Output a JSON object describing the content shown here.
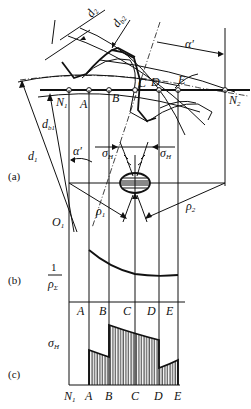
{
  "figure": {
    "type": "gear meshing contact stress diagram",
    "panels": [
      {
        "id": "a",
        "label": "(a)"
      },
      {
        "id": "b",
        "label": "(b)"
      },
      {
        "id": "c",
        "label": "(c)"
      }
    ],
    "points": {
      "N1": "N",
      "N1_sub": "1",
      "A": "A",
      "B": "B",
      "C": "C",
      "D": "D",
      "E": "E",
      "N2": "N",
      "N2_sub": "2",
      "O1": "O",
      "O1_sub": "1"
    },
    "dimension_labels": {
      "d2_prime": "d",
      "d2_prime_sub": "2",
      "d2_prime_mark": "′",
      "db2": "d",
      "db2_sub": "b2",
      "db1": "d",
      "db1_sub": "b1",
      "d1_prime": "d",
      "d1_prime_sub": "1",
      "d1_prime_mark": "′",
      "alpha_top": "α′",
      "alpha_left": "α′"
    },
    "stress_labels": {
      "sigma_left": "σ",
      "sigma_left_sub": "H",
      "sigma_right": "σ",
      "sigma_right_sub": "H",
      "rho1": "ρ",
      "rho1_sub": "1",
      "rho2": "ρ",
      "rho2_sub": "2"
    },
    "panel_b": {
      "ylabel_num": "1",
      "ylabel_den": "ρ",
      "ylabel_den_sub": "Σ",
      "x_labels": [
        "A",
        "B",
        "C",
        "D",
        "E"
      ]
    },
    "panel_c": {
      "ylabel": "σ",
      "ylabel_sub": "H",
      "x_labels": [
        "N",
        "A",
        "B",
        "C",
        "D",
        "E"
      ],
      "x_label_N_sub": "1"
    }
  }
}
